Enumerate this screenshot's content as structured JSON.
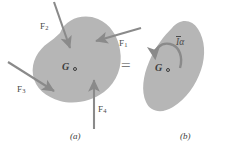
{
  "figure": {
    "type": "free-body-equivalence-diagram",
    "background_color": "#ffffff",
    "body_fill_color": "#b6b6b6",
    "arrow_color": "#8a8a8a",
    "text_color": "#4a4a4a",
    "equals_color": "#7d7d7d"
  },
  "panel_a": {
    "caption": "(a)",
    "centroid": {
      "label": "G",
      "marker": "open-circle"
    },
    "forces": [
      {
        "id": "F1",
        "base": "F",
        "subscript": "1",
        "direction": "left-down",
        "tail": [
          141,
          28
        ],
        "head": [
          96,
          41
        ],
        "label_x": 119,
        "label_y": 43
      },
      {
        "id": "F2",
        "base": "F",
        "subscript": "2",
        "direction": "down-right",
        "tail": [
          54,
          2
        ],
        "head": [
          70,
          48
        ],
        "label_x": 44,
        "label_y": 26
      },
      {
        "id": "F3",
        "base": "F",
        "subscript": "3",
        "direction": "right-down",
        "tail": [
          8,
          62
        ],
        "head": [
          54,
          91
        ],
        "label_x": 21,
        "label_y": 89
      },
      {
        "id": "F4",
        "base": "F",
        "subscript": "4",
        "direction": "up",
        "tail": [
          94,
          129
        ],
        "head": [
          94,
          80
        ],
        "label_x": 98,
        "label_y": 109
      }
    ]
  },
  "operator": {
    "symbol": "=",
    "x": 120,
    "y": 58
  },
  "panel_b": {
    "caption": "(b)",
    "centroid": {
      "label": "G",
      "marker": "open-circle"
    },
    "couple": {
      "label_inertia": "I",
      "label_alpha": "α",
      "overbar": true,
      "sense": "counter-clockwise",
      "label_x": 179,
      "label_y": 40
    }
  }
}
